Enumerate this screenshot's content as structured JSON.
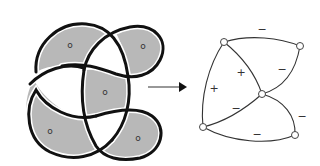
{
  "colors": {
    "shade": "#b8b8b8",
    "stroke": "#111111",
    "graph_stroke": "#333333",
    "vertex_fill": "#ffffff"
  },
  "knot": {
    "regions": [
      {
        "id": "top-left",
        "label": "o"
      },
      {
        "id": "top-right",
        "label": "o"
      },
      {
        "id": "center",
        "label": "o"
      },
      {
        "id": "bottom-left",
        "label": "o"
      },
      {
        "id": "bottom-right",
        "label": "o"
      }
    ]
  },
  "arrow": {
    "symbol": "→"
  },
  "graph": {
    "vertices": [
      {
        "id": "v-top-left"
      },
      {
        "id": "v-top-right"
      },
      {
        "id": "v-center"
      },
      {
        "id": "v-bottom-left"
      },
      {
        "id": "v-bottom-right"
      }
    ],
    "edge_signs": [
      {
        "edge": "top-left to top-right",
        "sign": "−"
      },
      {
        "edge": "top-right to center",
        "sign": "−"
      },
      {
        "edge": "top-left to center",
        "sign": "+"
      },
      {
        "edge": "top-left to bottom-left",
        "sign": "+"
      },
      {
        "edge": "center to bottom-left",
        "sign": "−"
      },
      {
        "edge": "center to bottom-right",
        "sign": "−"
      },
      {
        "edge": "bottom-left to bottom-right",
        "sign": "−"
      }
    ]
  }
}
